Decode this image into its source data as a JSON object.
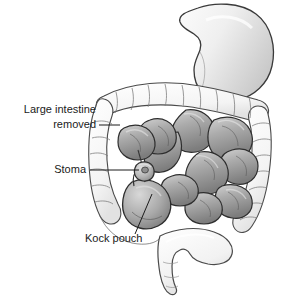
{
  "figure": {
    "background_color": "#ffffff",
    "width": 283,
    "height": 296
  },
  "labels": [
    {
      "id": "large-intestine-removed",
      "line1": "Large intestine",
      "line2": "removed",
      "text_anchor": "end",
      "x": 96,
      "y1": 113,
      "y2": 128,
      "leader": {
        "x1": 99,
        "y1": 125,
        "x2": 120,
        "y2": 125
      }
    },
    {
      "id": "stoma",
      "line1": "Stoma",
      "line2": "",
      "text_anchor": "end",
      "x": 86,
      "y1": 173,
      "y2": 0,
      "leader": {
        "x1": 90,
        "y1": 170,
        "x2": 139,
        "y2": 170
      }
    },
    {
      "id": "kock-pouch",
      "line1": "Kock pouch",
      "line2": "",
      "text_anchor": "start",
      "x": 85,
      "y1": 242,
      "y2": 0,
      "leader": {
        "x1": 135,
        "y1": 234,
        "x2": 152,
        "y2": 194
      }
    }
  ],
  "anatomy": {
    "stomach": {
      "name": "stomach",
      "fill": "#e9e9e9"
    },
    "large_intestine": {
      "name": "large-intestine-outline",
      "fill": "#f7f7f7",
      "stroke": "#4a4a4a"
    },
    "small_intestine": {
      "name": "small-intestine-coils",
      "fill": "#a8a8a8",
      "stroke": "#2e2e2e"
    },
    "pouch": {
      "name": "kock-pouch-reservoir",
      "fill": "#b0b0b0",
      "stroke": "#2e2e2e"
    },
    "stoma_nub": {
      "name": "stoma-nub",
      "fill": "#bdbdbd",
      "stroke": "#2e2e2e"
    },
    "rectum": {
      "name": "rectum-sigmoid",
      "fill": "#f4f4f4",
      "stroke": "#5a5a5a"
    }
  },
  "colors": {
    "label_text": "#1b1b1b",
    "leader_line": "#1b1b1b",
    "outline_dark": "#2e2e2e",
    "outline_light": "#4a4a4a"
  }
}
